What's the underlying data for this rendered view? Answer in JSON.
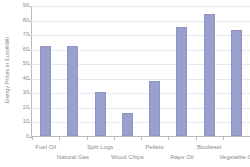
{
  "chart_data": {
    "type": "bar",
    "title": "",
    "subtitle": "",
    "xlabel": "",
    "ylabel": "Energy Prices in Euro/kWh",
    "categories": [
      "Fuel Oil",
      "Natural Gas",
      "Split Logs",
      "Wood Chips",
      "Pellets",
      "Rape Oil",
      "Biodiesel",
      "Vegetable Oi"
    ],
    "values": [
      62,
      61.5,
      30,
      15.5,
      38,
      75,
      84,
      73
    ],
    "ylim": [
      0,
      90
    ],
    "ytick_labels": [
      "0",
      "10",
      "20",
      "30",
      "40",
      "50",
      "60",
      "70",
      "80",
      "90"
    ],
    "ytick_values": [
      0,
      10,
      20,
      30,
      40,
      50,
      60,
      70,
      80,
      90
    ],
    "grid": "horizontal",
    "legend": "none",
    "bar_color": "#9aa0cd",
    "axis_color": "#b9b9c4",
    "grid_color": "#e9e9f1",
    "text_color": "#8c8c8c",
    "background": "#ffffff",
    "label_stagger": [
      0,
      1,
      0,
      1,
      0,
      1,
      0,
      1
    ],
    "note": "Last category label is clipped at the right edge of the figure."
  }
}
